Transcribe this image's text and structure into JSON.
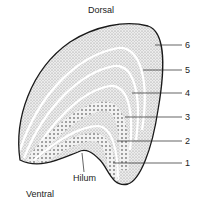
{
  "labels": {
    "dorsal": "Dorsal",
    "ventral": "Ventral",
    "hilum": "Hilum"
  },
  "layers": [
    {
      "id": 1,
      "label": "1",
      "y": 163
    },
    {
      "id": 2,
      "label": "2",
      "y": 141
    },
    {
      "id": 3,
      "label": "3",
      "y": 117
    },
    {
      "id": 4,
      "label": "4",
      "y": 93
    },
    {
      "id": 5,
      "label": "5",
      "y": 70
    },
    {
      "id": 6,
      "label": "6",
      "y": 45
    }
  ],
  "colors": {
    "outline": "#1a1a1a",
    "fill": "#d6d6d6",
    "band": "#ffffff",
    "text": "#222222"
  }
}
